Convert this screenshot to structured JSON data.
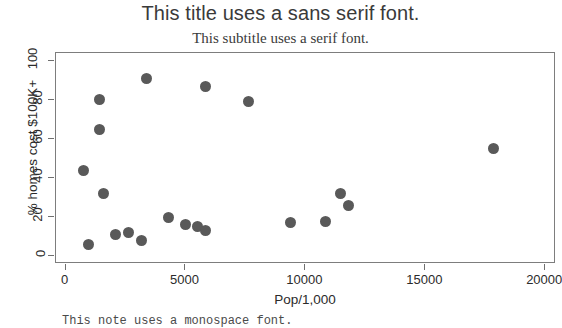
{
  "chart_data": {
    "type": "scatter",
    "title": "This title uses a sans serif font.",
    "subtitle": "This subtitle uses a serif font.",
    "caption": "This note uses a monospace font.",
    "xlabel": "Pop/1,000",
    "ylabel": "% homes cost $100K+",
    "xlim": [
      -400,
      20450
    ],
    "ylim": [
      -4,
      104
    ],
    "xticks": [
      0,
      5000,
      10000,
      15000,
      20000
    ],
    "xtick_labels": [
      "0",
      "5000",
      "10000",
      "15000",
      "20000"
    ],
    "yticks": [
      0,
      20,
      40,
      60,
      80,
      100
    ],
    "ytick_labels": [
      "0",
      "20",
      "40",
      "60",
      "80",
      "100"
    ],
    "grid": false,
    "legend": false,
    "point_color": "#595959",
    "panel_border_color": "#7d7d7d",
    "points": [
      {
        "x": 950,
        "y": 6
      },
      {
        "x": 760,
        "y": 44
      },
      {
        "x": 1400,
        "y": 80
      },
      {
        "x": 1400,
        "y": 65
      },
      {
        "x": 1580,
        "y": 32
      },
      {
        "x": 2080,
        "y": 11
      },
      {
        "x": 2620,
        "y": 12
      },
      {
        "x": 3170,
        "y": 8
      },
      {
        "x": 3380,
        "y": 91
      },
      {
        "x": 4290,
        "y": 20
      },
      {
        "x": 5000,
        "y": 16
      },
      {
        "x": 5500,
        "y": 15
      },
      {
        "x": 5830,
        "y": 87
      },
      {
        "x": 5830,
        "y": 13
      },
      {
        "x": 7620,
        "y": 79
      },
      {
        "x": 9380,
        "y": 17
      },
      {
        "x": 10830,
        "y": 18
      },
      {
        "x": 11460,
        "y": 32
      },
      {
        "x": 11790,
        "y": 26
      },
      {
        "x": 17830,
        "y": 55
      }
    ]
  }
}
